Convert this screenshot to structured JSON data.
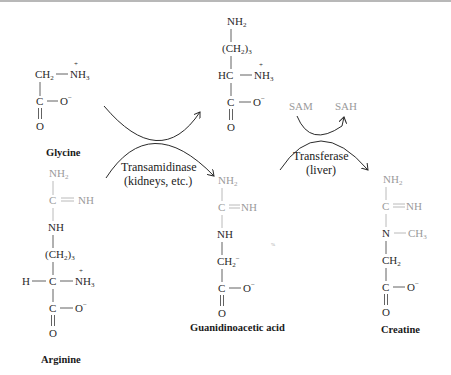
{
  "colors": {
    "primary_structure": "#2a2a2a",
    "highlight_group": "#9a9a9a",
    "background": "#ffffff"
  },
  "molecules": {
    "glycine": {
      "name": "Glycine",
      "top_left": "CH",
      "top_left_sub": "2",
      "amine": "NH",
      "amine_sub": "3",
      "charge_plus": "+",
      "carbon": "C",
      "carboxylate_o": "O",
      "carboxylate_charge": "−",
      "carbonyl_o": "O"
    },
    "arginine": {
      "name": "Arginine",
      "nh2": "NH",
      "nh2_sub": "2",
      "c_imine": "C",
      "imine_nh": "NH",
      "nh": "NH",
      "ch2_group": "(CH",
      "ch2_sub": "2",
      "ch2_close": ")",
      "ch2_count": "3",
      "h": "H",
      "alpha_c": "C",
      "amine": "NH",
      "amine_sub": "3",
      "charge_plus": "+",
      "carbon": "C",
      "carboxylate_o": "O",
      "carboxylate_charge": "−",
      "carbonyl_o": "O"
    },
    "ornithine": {
      "nh2": "NH",
      "nh2_sub": "2",
      "ch2_group": "(CH",
      "ch2_sub": "2",
      "ch2_close": ")",
      "ch2_count": "3",
      "hc": "HC",
      "amine": "NH",
      "amine_sub": "3",
      "charge_plus": "+",
      "carbon": "C",
      "carboxylate_o": "O",
      "carboxylate_charge": "−",
      "carbonyl_o": "O"
    },
    "guanidinoacetic_acid": {
      "name": "Guanidinoacetic acid",
      "nh2": "NH",
      "nh2_sub": "2",
      "c_imine": "C",
      "imine_nh": "NH",
      "nh": "NH",
      "ch2": "CH",
      "ch2_sub": "2",
      "ch2_charge": "−",
      "carbon": "C",
      "carboxylate_o": "O",
      "carboxylate_charge": "−",
      "carbonyl_o": "O"
    },
    "creatine": {
      "name": "Creatine",
      "nh2": "NH",
      "nh2_sub": "2",
      "c_imine": "C",
      "imine_nh": "NH",
      "n": "N",
      "methyl": "CH",
      "methyl_sub": "3",
      "ch2": "CH",
      "ch2_sub": "2",
      "carbon": "C",
      "carboxylate_o": "O",
      "carboxylate_charge": "−",
      "carbonyl_o": "O"
    }
  },
  "reactions": {
    "step1": {
      "enzyme": "Transamidinase",
      "location": "(kidneys, etc.)"
    },
    "step2": {
      "enzyme": "Transferase",
      "location": "(liver)",
      "cosubstrate_in": "SAM",
      "cosubstrate_out": "SAH"
    }
  }
}
